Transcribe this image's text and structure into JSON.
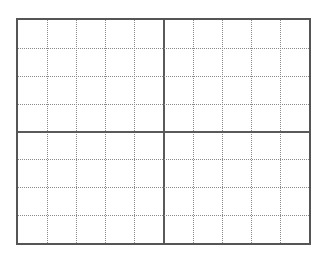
{
  "grid": {
    "columns": 10,
    "rows": 8,
    "border_color": "#555555",
    "minor_line_color": "#8a8a8a",
    "major_line_color": "#5a5a5a",
    "background": "#ffffff"
  }
}
